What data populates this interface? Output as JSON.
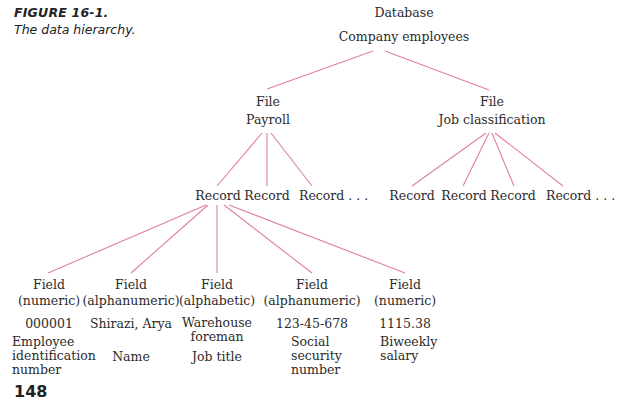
{
  "caption": {
    "figure": "FIGURE 16-1.",
    "title": "The data hierarchy."
  },
  "database": {
    "type": "Database",
    "name": "Company employees"
  },
  "files": [
    {
      "type": "File",
      "name": "Payroll"
    },
    {
      "type": "File",
      "name": "Job classification"
    }
  ],
  "payroll_records": [
    "Record",
    "Record",
    "Record . . ."
  ],
  "job_records": [
    "Record",
    "Record",
    "Record",
    "Record . . ."
  ],
  "fields": [
    {
      "type": "Field",
      "kind": "(numeric)",
      "value": "000001",
      "desc": [
        "Employee",
        "identification",
        "number"
      ]
    },
    {
      "type": "Field",
      "kind": "(alphanumeric)",
      "value": "Shirazi, Arya",
      "desc": [
        "Name"
      ]
    },
    {
      "type": "Field",
      "kind": "(alphabetic)",
      "value": [
        "Warehouse",
        "foreman"
      ],
      "desc": [
        "Job title"
      ]
    },
    {
      "type": "Field",
      "kind": "(alphanumeric)",
      "value": "123-45-678",
      "desc": [
        "Social",
        "security",
        "number"
      ]
    },
    {
      "type": "Field",
      "kind": "(numeric)",
      "value": "1115.38",
      "desc": [
        "Biweekly",
        "salary"
      ]
    }
  ],
  "colors": {
    "connector": "#e0809a",
    "text": "#2b2b2b"
  },
  "page_number": "148"
}
